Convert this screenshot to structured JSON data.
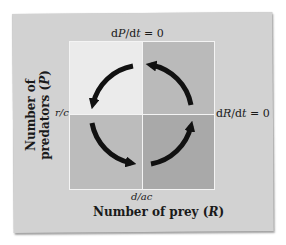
{
  "diagram": {
    "isoclines": {
      "predator": {
        "prefix": "d",
        "var": "P",
        "mid": "/d",
        "t": "t",
        "suffix": " = 0"
      },
      "prey": {
        "prefix": "d",
        "var": "R",
        "mid": "/d",
        "t": "t",
        "suffix": " = 0"
      }
    },
    "equilibrium": {
      "y_value": "r/c",
      "x_value": "d/ac"
    },
    "axes": {
      "x_label_text": "Number of prey (",
      "x_label_var": "R",
      "x_label_close": ")",
      "y_label_line1": "Number of",
      "y_label_line2_text": "predators (",
      "y_label_line2_var": "P",
      "y_label_line2_close": ")"
    },
    "quadrants": [
      {
        "position": "top-left",
        "color": "#ebebeb",
        "arrow_direction": "down-left"
      },
      {
        "position": "top-right",
        "color": "#bababa",
        "arrow_direction": "up-left"
      },
      {
        "position": "bottom-left",
        "color": "#bcbcbc",
        "arrow_direction": "down-right"
      },
      {
        "position": "bottom-right",
        "color": "#a9a9a9",
        "arrow_direction": "up-right"
      }
    ],
    "cycle_direction": "counterclockwise",
    "colors": {
      "card": "#d2d2d2",
      "arrow": "#111111",
      "divider": "#f4f4f4"
    }
  }
}
